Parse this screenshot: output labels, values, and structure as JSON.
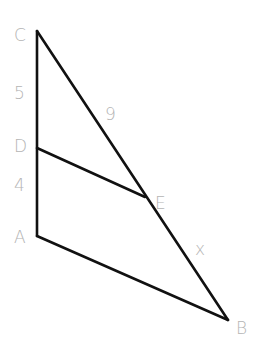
{
  "diagram": {
    "points": {
      "C": {
        "label": "C",
        "x": 37,
        "y": 31
      },
      "D": {
        "label": "D",
        "x": 37,
        "y": 148
      },
      "A": {
        "label": "A",
        "x": 37,
        "y": 236
      },
      "E": {
        "label": "E",
        "x": 145,
        "y": 197
      },
      "B": {
        "label": "B",
        "x": 228,
        "y": 320
      }
    },
    "measures": {
      "CD": "5",
      "DA": "4",
      "CE": "9",
      "EB": "x"
    },
    "colors": {
      "line": "#111111",
      "label": "#b4b4b4"
    }
  }
}
